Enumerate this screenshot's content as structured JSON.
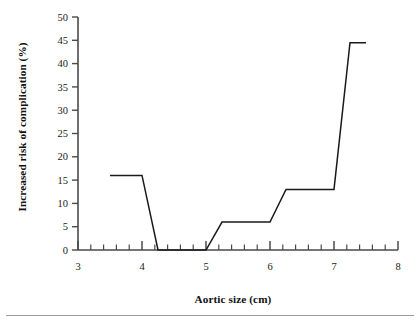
{
  "chart_data": {
    "type": "line",
    "title": "",
    "subtitle": "",
    "xlabel": "Aortic size (cm)",
    "ylabel": "Increased risk of complication (%)",
    "xlim": [
      3,
      8
    ],
    "ylim": [
      0,
      50
    ],
    "xticks": [
      3,
      4,
      5,
      6,
      7,
      8
    ],
    "xtick_labels": [
      "3",
      "4",
      "5",
      "6",
      "7",
      "8"
    ],
    "xminor_step": 0.2,
    "yticks": [
      0,
      5,
      10,
      15,
      20,
      25,
      30,
      35,
      40,
      45,
      50
    ],
    "ytick_labels": [
      "0",
      "5",
      "10",
      "15",
      "20",
      "25",
      "30",
      "35",
      "40",
      "45",
      "50"
    ],
    "grid": false,
    "legend": null,
    "series": [
      {
        "name": "Increased risk of complication",
        "color": "#1a1a1a",
        "x": [
          3.5,
          4.0,
          4.25,
          5.0,
          5.25,
          6.0,
          6.25,
          7.0,
          7.25,
          7.5
        ],
        "y": [
          16,
          16,
          0,
          0,
          6,
          6,
          13,
          13,
          44.5,
          44.5
        ]
      }
    ],
    "annotations": []
  },
  "figure": {
    "axis_color": "#4a4a4a",
    "line_color": "#1a1a1a",
    "background": "#ffffff",
    "rule_color": "#9a9a9a"
  }
}
